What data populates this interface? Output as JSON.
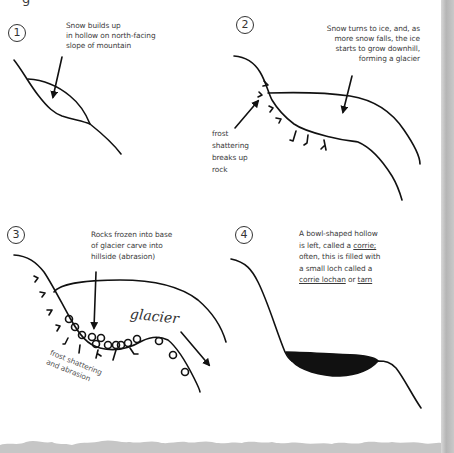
{
  "header": {
    "clipped_text": "g"
  },
  "panels": [
    {
      "number": "1",
      "caption_lines": [
        "Snow builds up",
        "in hollow on north-facing",
        "slope of mountain"
      ]
    },
    {
      "number": "2",
      "caption_lines": [
        "Snow turns to ice, and, as",
        "more snow falls, the ice",
        "starts to grow downhill,",
        "forming a glacier"
      ],
      "side_label_lines": [
        "frost",
        "shattering",
        "breaks up",
        "rock"
      ]
    },
    {
      "number": "3",
      "caption_lines": [
        "Rocks frozen into base",
        "of glacier carve into",
        "hillside (abrasion)"
      ],
      "glacier_label": "glacier",
      "side_label_lines": [
        "frost shattering",
        "and abrasion"
      ]
    },
    {
      "number": "4",
      "caption_line1": "A bowl-shaped hollow",
      "caption_line2_prefix": "is left, called a ",
      "caption_line2_term": "corrie;",
      "caption_line3": "often, this is filled with",
      "caption_line4": "a small loch called a",
      "caption_line5_term1": "corrie lochan",
      "caption_line5_mid": " or ",
      "caption_line5_term2": "tarn"
    }
  ],
  "colors": {
    "ink": "#111111",
    "text": "#3a3a3a",
    "edge": "#bdbdbd"
  }
}
